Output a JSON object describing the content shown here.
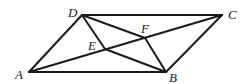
{
  "diagram": {
    "type": "geometry",
    "points": {
      "A": {
        "x": 29,
        "y": 72,
        "label": "A",
        "lx": 15,
        "ly": 79
      },
      "B": {
        "x": 166,
        "y": 72,
        "label": "B",
        "lx": 169,
        "ly": 82
      },
      "C": {
        "x": 222,
        "y": 15,
        "label": "C",
        "lx": 228,
        "ly": 19
      },
      "D": {
        "x": 82,
        "y": 15,
        "label": "D",
        "lx": 68,
        "ly": 17
      },
      "E": {
        "x": 105,
        "y": 49,
        "label": "E",
        "lx": 88,
        "ly": 50
      },
      "F": {
        "x": 145,
        "y": 38,
        "label": "F",
        "lx": 141,
        "ly": 33
      }
    },
    "segments": [
      [
        "A",
        "B"
      ],
      [
        "B",
        "C"
      ],
      [
        "C",
        "D"
      ],
      [
        "D",
        "A"
      ],
      [
        "A",
        "C"
      ],
      [
        "D",
        "E"
      ],
      [
        "E",
        "B"
      ],
      [
        "D",
        "F"
      ],
      [
        "F",
        "B"
      ]
    ],
    "colors": {
      "stroke": "#1a1a1a",
      "label": "#222222",
      "background": "#ffffff"
    }
  }
}
